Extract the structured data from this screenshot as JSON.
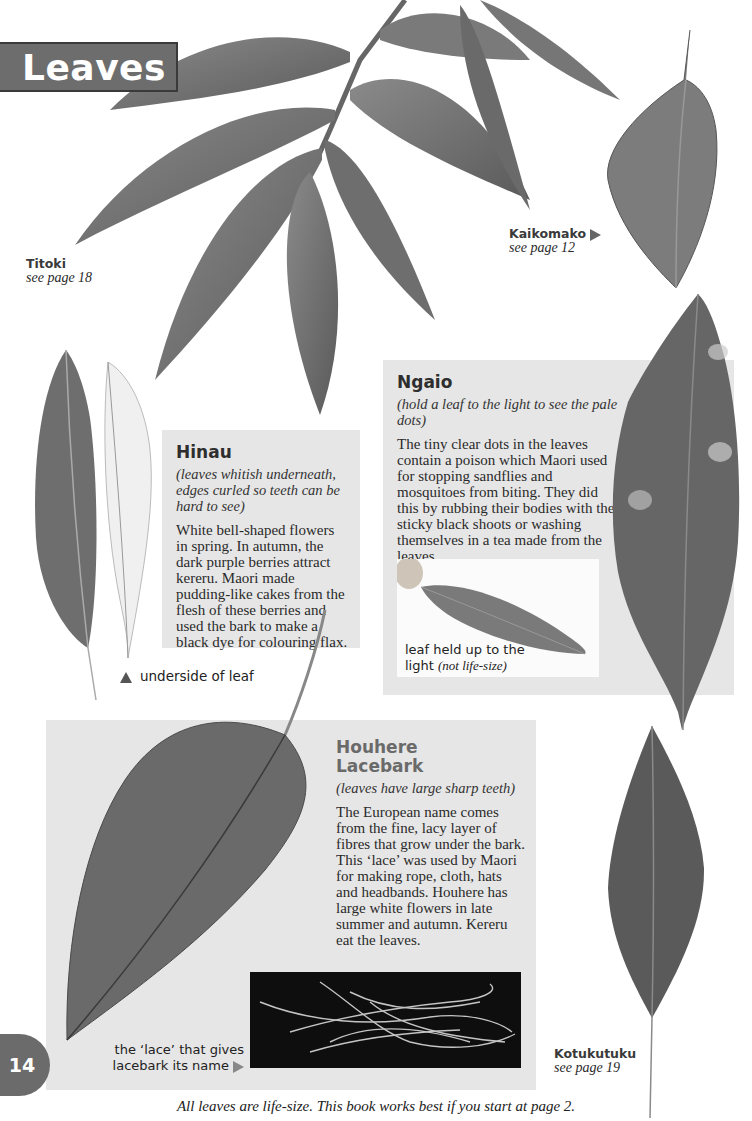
{
  "page": {
    "title": "Leaves",
    "page_number": "14",
    "footer": "All leaves are life-size. This book works best if you start at page 2."
  },
  "leaf_labels": {
    "titoki": {
      "name": "Titoki",
      "ref": "see page 18"
    },
    "kaikomako": {
      "name": "Kaikomako",
      "ref": "see page 12",
      "pointer": "triangle-right"
    },
    "kotukutuku": {
      "name": "Kotukutuku",
      "ref": "see page 19"
    }
  },
  "hinau": {
    "heading": "Hinau",
    "subtitle": "(leaves whitish underneath, edges curled so teeth can be hard to see)",
    "body": "White bell-shaped flowers in spring. In autumn, the dark purple berries attract kereru. Maori made pudding-like cakes from the flesh of these berries and used the bark to make a black dye for colouring flax.",
    "underside_caption": "underside of leaf",
    "underside_pointer": "triangle-up"
  },
  "ngaio": {
    "heading": "Ngaio",
    "subtitle": "(hold a leaf to the light to see the pale dots)",
    "body": "The tiny clear dots in the leaves contain a poison which Maori used for stopping sandflies and mosquitoes from biting. They did this by rubbing their bodies with the sticky black shoots or washing themselves in a tea made from the leaves.",
    "photo_caption_main": "leaf held up to the",
    "photo_caption_line2": "light",
    "photo_caption_note": "(not life-size)"
  },
  "houhere": {
    "heading_line1": "Houhere",
    "heading_line2": "Lacebark",
    "subtitle": "(leaves have large sharp teeth)",
    "body": "The European name comes from the fine, lacy layer of fibres that grow under the bark. This ‘lace’ was used by Maori for making rope, cloth, hats and headbands. Houhere has large white flowers in late summer and autumn. Kereru eat the leaves.",
    "lace_caption_line1": "the ‘lace’ that gives",
    "lace_caption_line2": "lacebark its name",
    "lace_pointer": "triangle-right"
  },
  "colors": {
    "banner": "#6d6d6d",
    "panel": "#e6e6e6",
    "houhere_heading": "#6a6a6a",
    "leaf_dark": "#555555"
  }
}
